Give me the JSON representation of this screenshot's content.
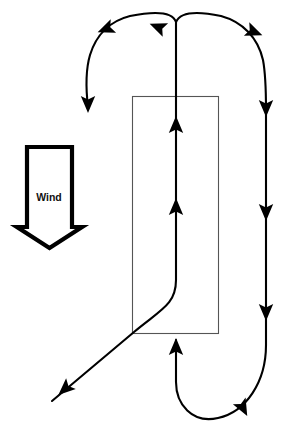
{
  "figure": {
    "kind": "search-pattern-diagram",
    "width": 286,
    "height": 434,
    "background_color": "#ffffff",
    "title": ""
  },
  "wind_indicator": {
    "label": "Wind",
    "direction": "down",
    "color": "#000000",
    "fill_color": "#ffffff",
    "label_color": "#111111",
    "shaft": {
      "left": 27,
      "right": 72,
      "top": 147,
      "bottom": 227
    },
    "head": {
      "left": 17,
      "right": 82,
      "top": 227,
      "tip_x": 49.5,
      "tip_y": 248
    },
    "label_position": {
      "x": 49,
      "y": 197
    }
  },
  "search_area": {
    "name": "search-area-rectangle",
    "stroke_color": "#555555",
    "x": 132,
    "y": 96,
    "width": 86,
    "height": 237
  },
  "track": {
    "name": "flight-track",
    "stroke_color": "#000000",
    "stroke_width": 2.1,
    "description": "Creeping line search track: ingress from lower-left, up the centre, over the top in two reversing turns, down the right side, bottom U-turn and back up.",
    "legs": [
      {
        "name": "ingress-diagonal",
        "from": [
          52,
          401
        ],
        "to": [
          135,
          332
        ],
        "direction": "up-right"
      },
      {
        "name": "centre-climb",
        "from": [
          135,
          332
        ],
        "to": [
          176,
          22
        ],
        "direction": "up"
      },
      {
        "name": "left-top-turn",
        "from": [
          176,
          22
        ],
        "to": [
          88,
          107
        ],
        "direction": "over-and-down-left"
      },
      {
        "name": "right-top-turn",
        "from": [
          176,
          22
        ],
        "to": [
          266,
          110
        ],
        "direction": "over-and-down-right"
      },
      {
        "name": "right-descent",
        "from": [
          266,
          110
        ],
        "to": [
          266,
          345
        ],
        "direction": "down"
      },
      {
        "name": "bottom-u-turn",
        "from": [
          266,
          345
        ],
        "to": [
          176,
          340
        ],
        "direction": "around-and-up"
      }
    ],
    "arrow_heads": [
      {
        "name": "arrow-centre-upper",
        "x": 176,
        "y": 125,
        "rotation": 0
      },
      {
        "name": "arrow-centre-lower",
        "x": 176,
        "y": 207,
        "rotation": 0
      },
      {
        "name": "arrow-top-left-outbound",
        "x": 105,
        "y": 29,
        "rotation": 248
      },
      {
        "name": "arrow-top-left-descent",
        "x": 88,
        "y": 104,
        "rotation": 180
      },
      {
        "name": "arrow-top-right-inbound",
        "x": 158,
        "y": 28,
        "rotation": 292
      },
      {
        "name": "arrow-top-right-outbound",
        "x": 256,
        "y": 33,
        "rotation": 110
      },
      {
        "name": "arrow-right-upper",
        "x": 266,
        "y": 108,
        "rotation": 180
      },
      {
        "name": "arrow-right-middle",
        "x": 266,
        "y": 212,
        "rotation": 180
      },
      {
        "name": "arrow-right-lower",
        "x": 266,
        "y": 312,
        "rotation": 180
      },
      {
        "name": "arrow-bottom-return",
        "x": 176,
        "y": 347,
        "rotation": 0
      },
      {
        "name": "arrow-bottom-u-turn",
        "x": 245,
        "y": 407,
        "rotation": 150
      },
      {
        "name": "arrow-ingress",
        "x": 65,
        "y": 389,
        "rotation": 228
      }
    ]
  }
}
